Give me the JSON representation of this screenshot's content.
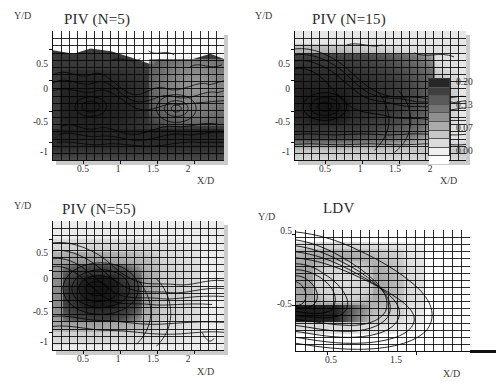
{
  "figure": {
    "kind": "2x2 contour panels of turbulence intensity",
    "axis_labels": {
      "x": "X/D",
      "y": "Y/D"
    },
    "colorbar": {
      "labels": [
        "0.20",
        "0.13",
        "0.07",
        "0.00"
      ],
      "levels": [
        0.0,
        0.02,
        0.04,
        0.07,
        0.09,
        0.11,
        0.13,
        0.16,
        0.18,
        0.2
      ],
      "min": 0.0,
      "max": 0.2,
      "bands": 10,
      "colors": [
        "#ffffff",
        "#f0f0f0",
        "#dcdcdc",
        "#c6c6c6",
        "#ababab",
        "#8f8f8f",
        "#757575",
        "#5a5a5a",
        "#3f3f3f",
        "#262626"
      ]
    }
  },
  "panels": [
    {
      "id": "piv-n5",
      "title": "PIV (N=5)",
      "xlabel": "X/D",
      "ylabel": "Y/D",
      "xticks": [
        "0.5",
        "1",
        "1.5",
        "2"
      ],
      "xtickvals": [
        0.5,
        1,
        1.5,
        2
      ],
      "yticks": [
        "0.5",
        "0",
        "-0.5",
        "-1"
      ],
      "ytickvals": [
        0.5,
        0,
        -0.5,
        -1
      ],
      "xlim": [
        0.1,
        2.4
      ],
      "ylim": [
        -1.3,
        0.8
      ],
      "grid_cols": 21,
      "grid_rows": 18
    },
    {
      "id": "piv-n15",
      "title": "PIV (N=15)",
      "xlabel": "X/D",
      "ylabel": "Y/D",
      "xticks": [
        "0.5",
        "1",
        "1.5",
        "2"
      ],
      "xtickvals": [
        0.5,
        1,
        1.5,
        2
      ],
      "yticks": [
        "0.5",
        "0",
        "-0.5",
        "-1"
      ],
      "ytickvals": [
        0.5,
        0,
        -0.5,
        -1
      ],
      "xlim": [
        0.1,
        2.4
      ],
      "ylim": [
        -1.3,
        0.8
      ],
      "grid_cols": 21,
      "grid_rows": 18
    },
    {
      "id": "piv-n55",
      "title": "PIV (N=55)",
      "xlabel": "X/D",
      "ylabel": "Y/D",
      "xticks": [
        "0.5",
        "1",
        "1.5",
        "2"
      ],
      "xtickvals": [
        0.5,
        1,
        1.5,
        2
      ],
      "yticks": [
        "0.5",
        "0",
        "-0.5",
        "-1"
      ],
      "ytickvals": [
        0.5,
        0,
        -0.5,
        -1
      ],
      "xlim": [
        0.1,
        2.4
      ],
      "ylim": [
        -1.3,
        0.8
      ],
      "grid_cols": 21,
      "grid_rows": 18
    },
    {
      "id": "ldv",
      "title": "LDV",
      "xlabel": "X/D",
      "ylabel": "Y/D",
      "xticks": [
        "0.5",
        "1.5"
      ],
      "xtickvals": [
        0.5,
        1.5
      ],
      "yticks": [
        "0.5",
        "-0.5"
      ],
      "ytickvals": [
        0.5,
        -0.5
      ],
      "xlim": [
        0.15,
        2.1
      ],
      "ylim": [
        -1.15,
        0.55
      ],
      "grid_cols": 19,
      "grid_rows": 17
    }
  ],
  "chart_data": {
    "type": "heatmap",
    "title": "",
    "xlabel": "X/D",
    "ylabel": "Y/D",
    "legend_position": "right-of-top-right-panel",
    "grid": true,
    "colorbar_labels": [
      "0.20",
      "0.13",
      "0.07",
      "0.00"
    ],
    "zrange": [
      0.0,
      0.2
    ],
    "contour_levels": [
      0.0,
      0.02,
      0.04,
      0.07,
      0.09,
      0.11,
      0.13,
      0.16,
      0.18,
      0.2
    ],
    "panels": [
      {
        "name": "PIV (N=5)",
        "xlim": [
          0.1,
          2.4
        ],
        "ylim": [
          -1.3,
          0.8
        ],
        "description": "Noisy field; high values (0.16-0.20) fill most of the lower and central region, low values (<0.07) only above Y/D~0.45",
        "peak_value": 0.2,
        "peak_location": [
          0.6,
          -0.35
        ]
      },
      {
        "name": "PIV (N=15)",
        "xlim": [
          0.1,
          2.4
        ],
        "ylim": [
          -1.3,
          0.8
        ],
        "description": "Smoother; dark core 0.18-0.20 spans X/D 0.1-1.4 between Y/D -1.0 and 0.4, decaying downstream",
        "peak_value": 0.2,
        "peak_location": [
          0.6,
          -0.4
        ]
      },
      {
        "name": "PIV (N=55)",
        "xlim": [
          0.1,
          2.4
        ],
        "ylim": [
          -1.3,
          0.8
        ],
        "description": "Well-converged; closed elliptical contours centred near X/D 0.9, Y/D -0.3 with peak 0.20, recirculation shear layers above and below",
        "peak_value": 0.2,
        "peak_location": [
          0.95,
          -0.3
        ]
      },
      {
        "name": "LDV",
        "xlim": [
          0.15,
          2.1
        ],
        "ylim": [
          -1.15,
          0.55
        ],
        "description": "Reference measurement; horseshoe shaped high-intensity band wrapping a lower-intensity core, peak band 0.16-0.20 along the shear layers",
        "peak_value": 0.2,
        "peak_location": [
          1.3,
          -0.45
        ]
      }
    ]
  }
}
